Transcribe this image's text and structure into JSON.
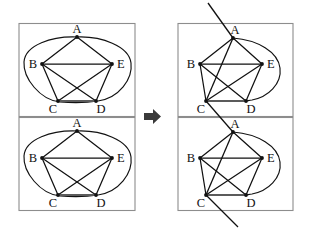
{
  "figure": {
    "title": "",
    "background_color": "#ffffff",
    "line_color": "#111111",
    "frame_color": "#8d8d8d",
    "accent_color": "#5b5b5b"
  },
  "arrow": {
    "name": "transformation-arrow",
    "direction": "right",
    "glyph": "➡",
    "color": "#3a3a3a"
  },
  "vertices": {
    "labels": [
      "A",
      "B",
      "C",
      "D",
      "E"
    ],
    "A": "A",
    "B": "B",
    "C": "C",
    "D": "D",
    "E": "E"
  },
  "panels": [
    {
      "id": "left-top",
      "side": "left",
      "position": "top",
      "has_cut_line": false,
      "curve_type": "closed-oval",
      "vertex_labels": {
        "A": "A",
        "B": "B",
        "C": "C",
        "D": "D",
        "E": "E"
      }
    },
    {
      "id": "left-bottom",
      "side": "left",
      "position": "bottom",
      "has_cut_line": false,
      "curve_type": "closed-oval",
      "vertex_labels": {
        "A": "A",
        "B": "B",
        "C": "C",
        "D": "D",
        "E": "E"
      }
    },
    {
      "id": "right-top",
      "side": "right",
      "position": "top",
      "has_cut_line": true,
      "curve_type": "arc-A-to-D",
      "vertex_labels": {
        "A": "A",
        "B": "B",
        "C": "C",
        "D": "D",
        "E": "E"
      }
    },
    {
      "id": "right-bottom",
      "side": "right",
      "position": "bottom",
      "has_cut_line": true,
      "curve_type": "arc-A-to-D",
      "vertex_labels": {
        "A": "A",
        "B": "B",
        "C": "C",
        "D": "D",
        "E": "E"
      }
    }
  ],
  "edges": {
    "straight": [
      "A-B",
      "A-E",
      "B-E",
      "B-C",
      "B-D",
      "C-E",
      "D-E",
      "C-D"
    ],
    "curved": [
      "A-C-via-outer-curve",
      "A-D-via-outer-curve"
    ]
  }
}
